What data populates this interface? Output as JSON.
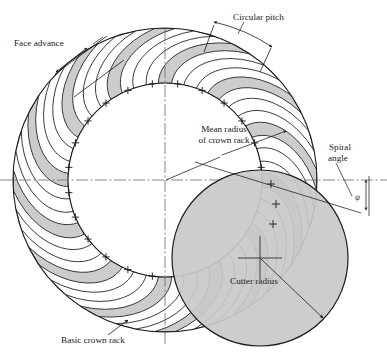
{
  "figure": {
    "type": "engineering-diagram"
  },
  "labels": {
    "face_advance": "Face advance",
    "circular_pitch": "Circular pitch",
    "mean_radius_line1": "Mean radius",
    "mean_radius_line2": "of crown rack",
    "spiral_angle_line1": "Spiral",
    "spiral_angle_line2": "angle",
    "spiral_angle_symbol": "ψ",
    "cutter_radius": "Cutter radius",
    "basic_crown_rack": "Basic crown rack"
  },
  "geometry": {
    "crown_center_x": 165,
    "crown_center_y": 180,
    "outer_radius": 152,
    "mean_radius": 97,
    "cutter_center_x": 260,
    "cutter_center_y": 258,
    "cutter_radius": 88,
    "tooth_count": 24,
    "spiral_angle_deg": 25,
    "plus_mark_count": 24,
    "plus_mark_radius": 97
  },
  "colors": {
    "tooth_shaded_fill": "#c9c9c9",
    "tooth_blank_fill": "#ffffff",
    "cutter_fill": "#c9c9c9",
    "outline": "#1a1a1a",
    "centerline": "#6b6b6b",
    "leader": "#1a1a1a",
    "background": "#ffffff"
  }
}
